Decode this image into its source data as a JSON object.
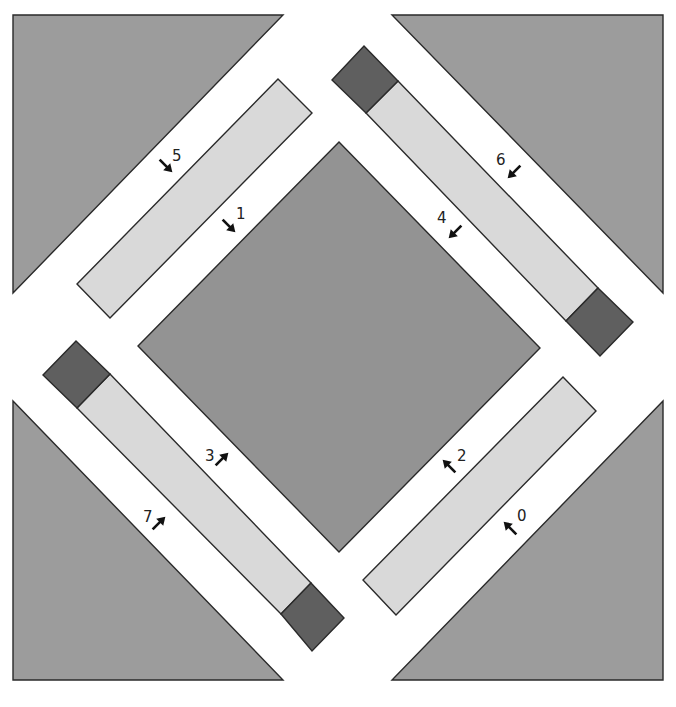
{
  "figure": {
    "type": "quilt-block-assembly-diagram",
    "colors": {
      "background": "#ffffff",
      "corner_triangle": "#9c9c9c",
      "center_diamond": "#939393",
      "light_strip": "#d9d9d9",
      "dark_square": "#5f5f5f",
      "outline": "#2a2a2a",
      "arrow": "#111111"
    },
    "corner_triangles": [
      {
        "name": "corner-triangle-top-left",
        "points": "13,15 283,15 13,293"
      },
      {
        "name": "corner-triangle-top-right",
        "points": "392,15 663,15 663,293"
      },
      {
        "name": "corner-triangle-bottom-left",
        "points": "13,401 283,680 13,680"
      },
      {
        "name": "corner-triangle-bottom-right",
        "points": "663,401 663,680 392,680"
      }
    ],
    "center_diamond": {
      "points": "339,142 540,348 339,552 138,346"
    },
    "light_strips": [
      {
        "name": "strip-upper-left",
        "points": "278,79 312,113 110,318 77,284"
      },
      {
        "name": "strip-upper-right",
        "points": "398,81 366,113 566,321 598,288"
      },
      {
        "name": "strip-lower-left",
        "points": "110,374 77,408 281,614 311,583"
      },
      {
        "name": "strip-lower-right",
        "points": "563,377 596,411 396,615 363,580"
      }
    ],
    "dark_squares": [
      {
        "name": "cornerstone-upper-right-top",
        "points": "364,46 398,81 366,113 332,80"
      },
      {
        "name": "cornerstone-upper-right-bottom",
        "points": "598,288 633,322 600,356 566,321"
      },
      {
        "name": "cornerstone-lower-left-top",
        "points": "76,341 110,374 77,408 43,375"
      },
      {
        "name": "cornerstone-lower-left-bottom",
        "points": "311,583 344,618 312,651 281,614"
      }
    ],
    "step_labels": [
      {
        "text": "5",
        "x": 172,
        "y": 161,
        "arrow": {
          "x": 166,
          "y": 166,
          "angle": 45
        }
      },
      {
        "text": "1",
        "x": 236,
        "y": 219,
        "arrow": {
          "x": 229,
          "y": 226,
          "angle": 45
        }
      },
      {
        "text": "6",
        "x": 496,
        "y": 165,
        "arrow": {
          "x": 514,
          "y": 172,
          "angle": 135
        }
      },
      {
        "text": "4",
        "x": 437,
        "y": 223,
        "arrow": {
          "x": 455,
          "y": 232,
          "angle": 135
        }
      },
      {
        "text": "3",
        "x": 205,
        "y": 461,
        "arrow": {
          "x": 222,
          "y": 459,
          "angle": -45
        }
      },
      {
        "text": "7",
        "x": 143,
        "y": 522,
        "arrow": {
          "x": 159,
          "y": 523,
          "angle": -45
        }
      },
      {
        "text": "2",
        "x": 457,
        "y": 461,
        "arrow": {
          "x": 449,
          "y": 466,
          "angle": -135
        }
      },
      {
        "text": "0",
        "x": 517,
        "y": 521,
        "arrow": {
          "x": 510,
          "y": 528,
          "angle": -135
        }
      }
    ]
  }
}
